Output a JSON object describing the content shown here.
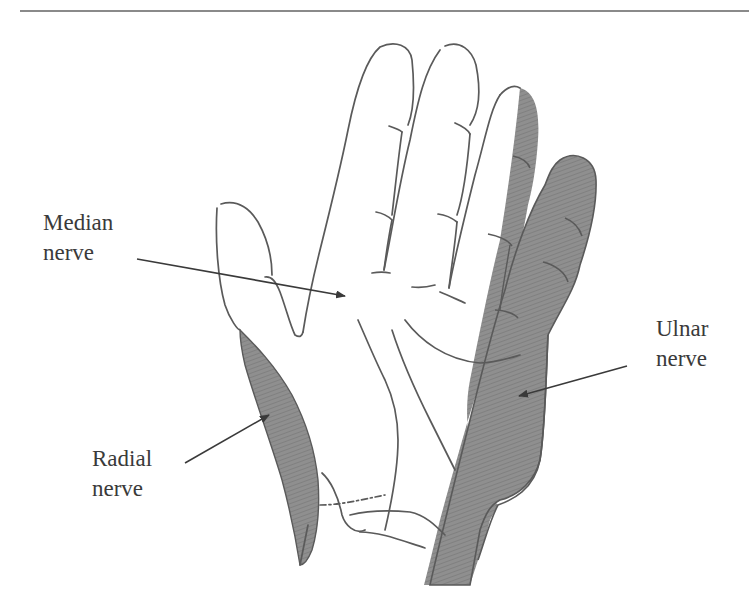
{
  "figure": {
    "labels": {
      "median": {
        "line1": "Median",
        "line2": "nerve"
      },
      "radial": {
        "line1": "Radial",
        "line2": "nerve"
      },
      "ulnar": {
        "line1": "Ulnar",
        "line2": "nerve"
      }
    },
    "colors": {
      "outline": "#5a5a5a",
      "shade": "#8c8c8c",
      "shade_dark": "#7a7a7a",
      "arrow": "#3a3a3a",
      "text": "#3a3a3a",
      "rule": "#8a8a8a"
    }
  }
}
